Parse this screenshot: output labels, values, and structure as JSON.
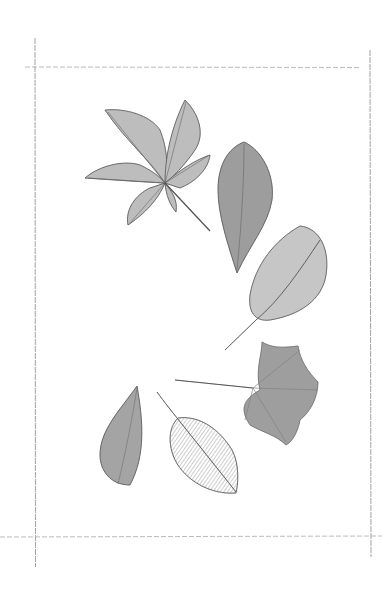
{
  "artwork": {
    "type": "pencil botanical illustration",
    "paper_color": "#ffffff",
    "line_color": "#555555",
    "leaves": [
      {
        "id": "horse-chestnut-leaf",
        "kind": "palmate compound, 5 leaflets"
      },
      {
        "id": "ovate-dark-leaf",
        "kind": "lanceolate / ovate, point down"
      },
      {
        "id": "beech-like-leaf",
        "kind": "obovate with long stem"
      },
      {
        "id": "maple-leaf",
        "kind": "palmate lobed with long stem"
      },
      {
        "id": "small-pointed-leaf",
        "kind": "ovate pointed up"
      },
      {
        "id": "skeleton-leaf",
        "kind": "ovate veined leaf with stem"
      }
    ]
  }
}
